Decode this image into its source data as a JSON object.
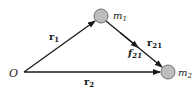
{
  "diagram": {
    "type": "vector-diagram",
    "origin": {
      "label": "O",
      "x": 24,
      "y": 72
    },
    "masses": [
      {
        "id": "m1",
        "label_main": "m",
        "label_sub": "1",
        "cx": 101,
        "cy": 16,
        "r": 7,
        "fill": "#bdbdbd",
        "stroke": "#555555"
      },
      {
        "id": "m2",
        "label_main": "m",
        "label_sub": "2",
        "cx": 168,
        "cy": 72,
        "r": 7,
        "fill": "#bdbdbd",
        "stroke": "#555555"
      }
    ],
    "vectors": [
      {
        "id": "r1",
        "label_main": "r",
        "label_sub": "1",
        "from": "O",
        "to": "m1",
        "style": "bold"
      },
      {
        "id": "r2",
        "label_main": "r",
        "label_sub": "2",
        "from": "O",
        "to": "m2",
        "style": "bold"
      },
      {
        "id": "r21",
        "label_main": "r",
        "label_sub": "21",
        "from": "m1",
        "to": "m2",
        "style": "bold"
      },
      {
        "id": "f21",
        "label_main": "f",
        "label_sub": "21",
        "from": "m1",
        "to": "m2",
        "style": "bold-italic"
      }
    ],
    "colors": {
      "line": "#1a1a1a",
      "mass_fill": "#bdbdbd",
      "mass_stroke": "#555555",
      "background": "#ffffff"
    }
  }
}
